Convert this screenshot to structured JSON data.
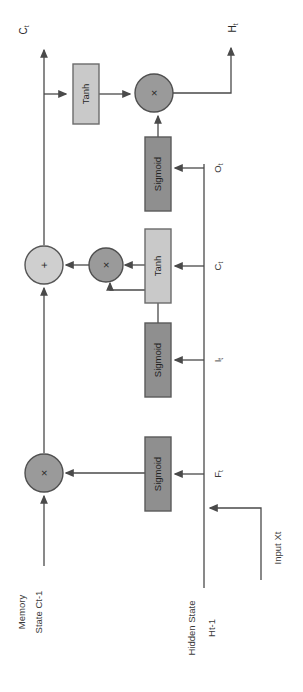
{
  "diagram": {
    "orientation": "rotated-90-ccw",
    "colors": {
      "sigmoid_fill": "#8f8f8f",
      "sigmoid_stroke": "#5a5a5a",
      "tanh_fill": "#c9c9c9",
      "tanh_stroke": "#6b6b6b",
      "multiply_fill": "#9a9a9a",
      "multiply_stroke": "#4f4f4f",
      "add_fill": "#cfcfcf",
      "add_stroke": "#555555",
      "line": "#4a4a4a",
      "background": "#ffffff",
      "text": "#2b2b2b"
    },
    "blocks": [
      {
        "id": "tanh_out",
        "label": "Tanh",
        "type": "tanh",
        "x": 73,
        "y": 64,
        "w": 26,
        "h": 60
      },
      {
        "id": "sigmoid_o",
        "label": "Sigmoid",
        "type": "sigmoid",
        "x": 145,
        "y": 137,
        "w": 26,
        "h": 74
      },
      {
        "id": "tanh_c",
        "label": "Tanh",
        "type": "tanh",
        "x": 145,
        "y": 229,
        "w": 26,
        "h": 74
      },
      {
        "id": "sigmoid_i",
        "label": "Sigmoid",
        "type": "sigmoid",
        "x": 145,
        "y": 323,
        "w": 26,
        "h": 74
      },
      {
        "id": "sigmoid_f",
        "label": "Sigmoid",
        "type": "sigmoid",
        "x": 145,
        "y": 437,
        "w": 26,
        "h": 74
      }
    ],
    "operators": [
      {
        "id": "mult_out",
        "symbol": "×",
        "type": "multiply",
        "cx": 154,
        "cy": 93,
        "r": 19
      },
      {
        "id": "add_cell",
        "symbol": "+",
        "type": "add",
        "cx": 44,
        "cy": 265,
        "r": 19
      },
      {
        "id": "mult_input",
        "symbol": "×",
        "type": "multiply",
        "cx": 106,
        "cy": 265,
        "r": 17
      },
      {
        "id": "mult_forget",
        "symbol": "×",
        "type": "multiply",
        "cx": 44,
        "cy": 473,
        "r": 19
      }
    ],
    "io_labels": [
      {
        "id": "out_cell",
        "text": "Ct",
        "base": "C",
        "sub": "t",
        "x": 22,
        "y": 30
      },
      {
        "id": "out_hidden",
        "text": "Ht",
        "base": "H",
        "sub": "t",
        "x": 231,
        "y": 28
      },
      {
        "id": "in_memory",
        "text": "Memory",
        "line2": "State Ct-1",
        "x": 30,
        "y": 600
      },
      {
        "id": "in_hidden",
        "text": "Hidden State",
        "line2": "Ht-1",
        "x": 200,
        "y": 620
      },
      {
        "id": "in_input",
        "text": "Input Xt",
        "x": 276,
        "y": 545
      }
    ],
    "gate_labels": [
      {
        "id": "gate_o",
        "base": "O",
        "sub": "t",
        "x": 216,
        "y": 168
      },
      {
        "id": "gate_c",
        "base": "C",
        "sub": "t",
        "x": 216,
        "y": 266
      },
      {
        "id": "gate_i",
        "base": "I",
        "sub": "t",
        "x": 216,
        "y": 360
      },
      {
        "id": "gate_f",
        "base": "F",
        "sub": "t",
        "x": 216,
        "y": 474
      }
    ]
  }
}
